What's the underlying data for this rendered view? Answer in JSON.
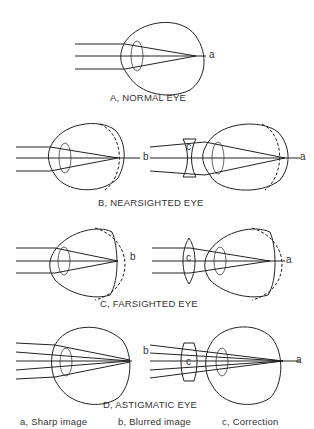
{
  "panels": [
    {
      "id": "A",
      "caption": "A, NORMAL EYE",
      "labels": {
        "right": "a"
      }
    },
    {
      "id": "B",
      "caption": "B, NEARSIGHTED EYE",
      "labels": {
        "left": "b",
        "lens": "c",
        "right": "a"
      }
    },
    {
      "id": "C",
      "caption": "C, FARSIGHTED EYE",
      "labels": {
        "left": "b",
        "lens": "c",
        "right": "a"
      }
    },
    {
      "id": "D",
      "caption": "D, ASTIGMATIC EYE",
      "labels": {
        "left": "b",
        "lens": "c",
        "right": "a"
      }
    }
  ],
  "legend": [
    "a, Sharp image",
    "b, Blurred image",
    "c, Correction"
  ]
}
